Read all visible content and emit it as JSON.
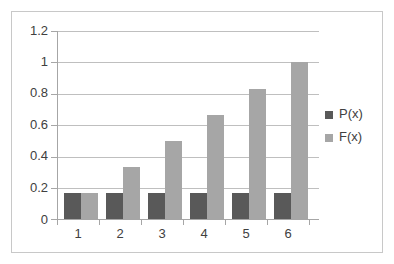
{
  "chart_data": {
    "type": "bar",
    "title": "",
    "subtitle": "",
    "xlabel": "",
    "ylabel": "",
    "categories": [
      "1",
      "2",
      "3",
      "4",
      "5",
      "6"
    ],
    "series": [
      {
        "name": "P(x)",
        "color": "#595959",
        "values": [
          0.167,
          0.167,
          0.167,
          0.167,
          0.167,
          0.167
        ]
      },
      {
        "name": "F(x)",
        "color": "#a6a6a6",
        "values": [
          0.167,
          0.333,
          0.5,
          0.667,
          0.833,
          1.0
        ]
      }
    ],
    "ylim": [
      0,
      1.2
    ],
    "yticks": [
      0,
      0.2,
      0.4,
      0.6,
      0.8,
      1,
      1.2
    ],
    "ytick_labels": [
      "0",
      "0.2",
      "0.4",
      "0.6",
      "0.8",
      "1",
      "1.2"
    ],
    "grid": true,
    "grid_axis": "y",
    "legend": [
      "P(x)",
      "F(x)"
    ],
    "legend_position": "right",
    "bar_orientation": "vertical",
    "grouped": true
  },
  "axes": {
    "y_labels": [
      "1.2",
      "1",
      "0.8",
      "0.6",
      "0.4",
      "0.2",
      "0"
    ],
    "x_labels": [
      "1",
      "2",
      "3",
      "4",
      "5",
      "6"
    ]
  },
  "legend": {
    "items": [
      {
        "label": "P(x)",
        "swatch": "dark-gray-swatch"
      },
      {
        "label": "F(x)",
        "swatch": "light-gray-swatch"
      }
    ]
  },
  "colors": {
    "series_p": "#595959",
    "series_f": "#a6a6a6",
    "gridline": "#bfbfbf",
    "axis": "#a6a6a6",
    "frame_border": "#c8c8c8",
    "text": "#404040",
    "background": "#ffffff"
  }
}
